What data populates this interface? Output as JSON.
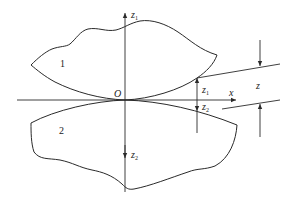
{
  "figure": {
    "type": "contact-geometry-diagram",
    "bodies": [
      {
        "id": "body-1",
        "label": "1"
      },
      {
        "id": "body-2",
        "label": "2"
      }
    ],
    "origin_label": "O",
    "axes": {
      "x_label": "x",
      "z1_axis_label": "z",
      "z1_axis_sub": "1",
      "z2_axis_label": "z",
      "z2_axis_sub": "2"
    },
    "dimensions": {
      "z1_label": "z",
      "z1_sub": "1",
      "z2_label": "z",
      "z2_sub": "2",
      "z_label": "z"
    },
    "colors": {
      "stroke": "#2a2a2a",
      "background": "#ffffff"
    }
  }
}
